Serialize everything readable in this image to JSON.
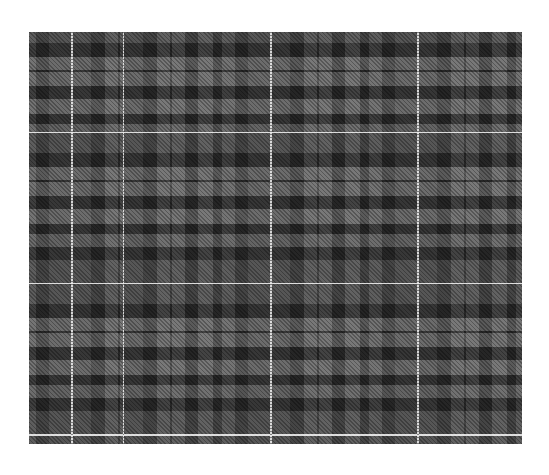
{
  "image": {
    "subject": "grey tartan plaid fabric pattern",
    "background_color": "#ffffff",
    "colors": {
      "light_grey": "#7a7a7a",
      "dark_grey": "#4f4f4f",
      "black": "#111111",
      "white_line": "#f2f2f2"
    }
  }
}
